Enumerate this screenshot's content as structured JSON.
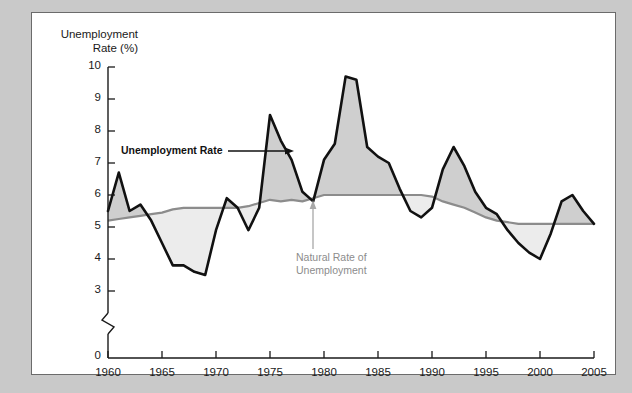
{
  "figure": {
    "background_color": "#c9c9c9",
    "panel_color": "#ffffff",
    "border_color": "#6b6b6b"
  },
  "annotations": {
    "unemployment_rate_label": "Unemployment Rate",
    "natural_rate_label": "Natural Rate of\nUnemployment",
    "natural_rate_color": "#8c8c8c",
    "unemployment_rate_color": "#111111"
  },
  "chart_data": {
    "type": "line",
    "title": "Unemployment\nRate (%)",
    "xlabel": "",
    "ylabel": "Unemployment Rate (%)",
    "ylim": [
      3,
      10
    ],
    "y_axis_break": true,
    "y_axis_break_between": [
      0,
      3
    ],
    "y_zero_label": "0",
    "grid": false,
    "legend": "annotated-inline",
    "yticks": [
      3,
      4,
      5,
      6,
      7,
      8,
      9,
      10
    ],
    "ytick_labels": [
      "3",
      "4",
      "5",
      "6",
      "7",
      "8",
      "9",
      "10"
    ],
    "xlim": [
      1960,
      2005
    ],
    "xticks": [
      1960,
      1965,
      1970,
      1975,
      1980,
      1985,
      1990,
      1995,
      2000,
      2005
    ],
    "xtick_labels": [
      "1960",
      "1965",
      "1970",
      "1975",
      "1980",
      "1985",
      "1990",
      "1995",
      "2000",
      "2005"
    ],
    "x": [
      1960,
      1961,
      1962,
      1963,
      1964,
      1965,
      1966,
      1967,
      1968,
      1969,
      1970,
      1971,
      1972,
      1973,
      1974,
      1975,
      1976,
      1977,
      1978,
      1979,
      1980,
      1981,
      1982,
      1983,
      1984,
      1985,
      1986,
      1987,
      1988,
      1989,
      1990,
      1991,
      1992,
      1993,
      1994,
      1995,
      1996,
      1997,
      1998,
      1999,
      2000,
      2001,
      2002,
      2003,
      2004,
      2005
    ],
    "series": [
      {
        "name": "Unemployment Rate",
        "color": "#111111",
        "values": [
          5.5,
          6.7,
          5.5,
          5.7,
          5.2,
          4.5,
          3.8,
          3.8,
          3.6,
          3.5,
          4.9,
          5.9,
          5.6,
          4.9,
          5.6,
          8.5,
          7.7,
          7.1,
          6.1,
          5.8,
          7.1,
          7.6,
          9.7,
          9.6,
          7.5,
          7.2,
          7.0,
          6.2,
          5.5,
          5.3,
          5.6,
          6.8,
          7.5,
          6.9,
          6.1,
          5.6,
          5.4,
          4.9,
          4.5,
          4.2,
          4.0,
          4.8,
          5.8,
          6.0,
          5.5,
          5.1
        ]
      },
      {
        "name": "Natural Rate of Unemployment",
        "color": "#8c8c8c",
        "values": [
          5.2,
          5.25,
          5.3,
          5.35,
          5.4,
          5.45,
          5.55,
          5.6,
          5.6,
          5.6,
          5.6,
          5.6,
          5.6,
          5.65,
          5.75,
          5.85,
          5.8,
          5.85,
          5.8,
          5.9,
          6.0,
          6.0,
          6.0,
          6.0,
          6.0,
          6.0,
          6.0,
          6.0,
          6.0,
          6.0,
          5.95,
          5.8,
          5.7,
          5.6,
          5.45,
          5.3,
          5.2,
          5.15,
          5.1,
          5.1,
          5.1,
          5.1,
          5.1,
          5.1,
          5.1,
          5.1
        ]
      }
    ],
    "fill_above_natural_color": "#cfcfcf",
    "fill_below_natural_color": "#ececec"
  }
}
